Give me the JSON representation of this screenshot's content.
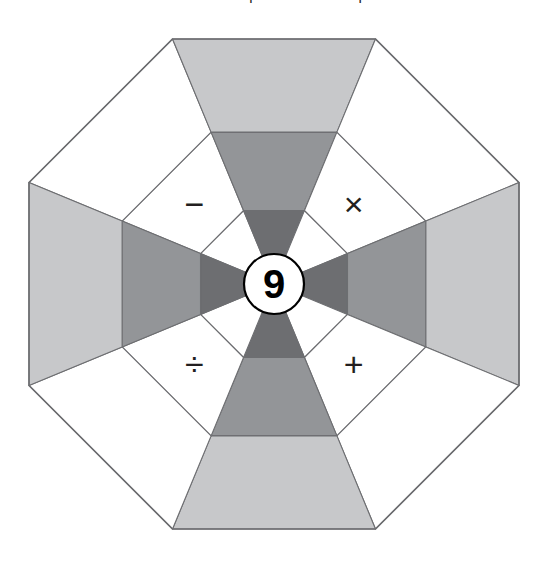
{
  "caption": {
    "text": "Here is how the pieces fit on the puzzle."
  },
  "puzzle": {
    "name": "octagon-operator-wheel",
    "center_value": "9",
    "shape": "octagon",
    "ring_count": 3,
    "sector_count": 8,
    "colors": {
      "background": "#ffffff",
      "outline": "#6d6e71",
      "white_cell": "#ffffff",
      "light_gray": "#c7c8ca",
      "medium_gray": "#939598",
      "dark_gray": "#6d6e71",
      "ink": "#231f20"
    },
    "geometry": {
      "center_x": 274,
      "center_y": 284,
      "apothem": 245,
      "ring_fractions": [
        0.3,
        0.62,
        1.0
      ],
      "hub_radius": 30
    },
    "sectors": [
      {
        "id": "sector-n",
        "direction": "north",
        "angle_deg": 270,
        "operator": "−",
        "operator_name": "minus-sign",
        "shaded": false
      },
      {
        "id": "sector-ne",
        "direction": "northeast",
        "angle_deg": 315,
        "operator": "",
        "operator_name": "",
        "shaded": true
      },
      {
        "id": "sector-e",
        "direction": "east",
        "angle_deg": 0,
        "operator": "×",
        "operator_name": "multiplication-sign",
        "shaded": false
      },
      {
        "id": "sector-se",
        "direction": "southeast",
        "angle_deg": 45,
        "operator": "",
        "operator_name": "",
        "shaded": true
      },
      {
        "id": "sector-s",
        "direction": "south",
        "angle_deg": 90,
        "operator": "+",
        "operator_name": "plus-sign",
        "shaded": false
      },
      {
        "id": "sector-sw",
        "direction": "southwest",
        "angle_deg": 135,
        "operator": "",
        "operator_name": "",
        "shaded": true
      },
      {
        "id": "sector-w",
        "direction": "west",
        "angle_deg": 180,
        "operator": "÷",
        "operator_name": "division-sign",
        "shaded": false
      },
      {
        "id": "sector-nw",
        "direction": "northwest",
        "angle_deg": 225,
        "operator": "",
        "operator_name": "",
        "shaded": true
      }
    ],
    "shaded_ring_colors": [
      "#6d6e71",
      "#939598",
      "#c7c8ca"
    ],
    "plain_ring_colors": [
      "#ffffff",
      "#ffffff",
      "#ffffff"
    ]
  }
}
